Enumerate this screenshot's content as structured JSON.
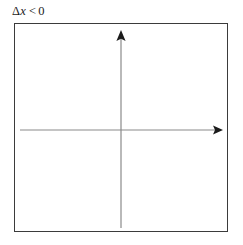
{
  "figure": {
    "caption": {
      "full_text": "Δx < 0",
      "delta": "Δ",
      "variable": "x",
      "relation": "<",
      "number": "0"
    },
    "frame": {
      "stroke_color": "#3b3b3b",
      "fill_color": "#ffffff",
      "stroke_width": 1.5
    },
    "axes": {
      "stroke_color": "#8a8a8a",
      "stroke_width": 1.2,
      "arrowhead_color": "#1b1b1b",
      "origin": {
        "x": 121,
        "y": 130
      },
      "x_axis": {
        "name": "horizontal-axis",
        "start": {
          "x": 20,
          "y": 130
        },
        "end": {
          "x": 223,
          "y": 130
        },
        "arrow": "right"
      },
      "y_axis": {
        "name": "vertical-axis",
        "start": {
          "x": 121,
          "y": 228
        },
        "end": {
          "x": 121,
          "y": 30
        },
        "arrow": "up"
      }
    },
    "background_color": "#ffffff"
  }
}
